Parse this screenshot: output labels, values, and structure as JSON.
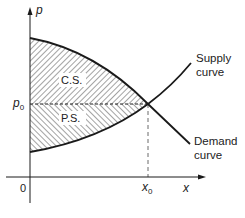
{
  "diagram": {
    "axes": {
      "y_label": "p",
      "x_label": "x",
      "origin_label": "0",
      "p0_label_main": "p",
      "p0_label_sub": "0",
      "x0_label_main": "x",
      "x0_label_sub": "0"
    },
    "regions": {
      "consumer_surplus": "C.S.",
      "producer_surplus": "P.S."
    },
    "curves": {
      "supply_line1": "Supply",
      "supply_line2": "curve",
      "demand_line1": "Demand",
      "demand_line2": "curve"
    },
    "colors": {
      "ink": "#1a1a1a",
      "background": "#ffffff"
    }
  }
}
